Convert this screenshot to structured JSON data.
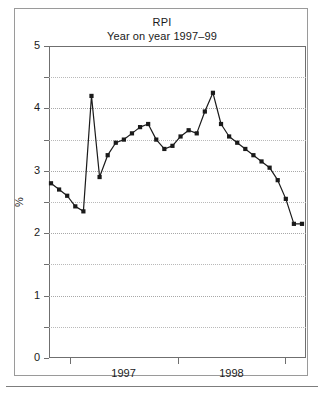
{
  "figure": {
    "title": "RPI",
    "subtitle": "Year on year 1997–99"
  },
  "chart_data": {
    "type": "line",
    "title": "RPI",
    "subtitle": "Year on year 1997–99",
    "xlabel": "",
    "ylabel": "%",
    "ylim": [
      0,
      5
    ],
    "ytick_labels": [
      "0",
      "1",
      "2",
      "3",
      "4",
      "5"
    ],
    "ytick_values": [
      0,
      1,
      2,
      3,
      4,
      5
    ],
    "yminor_step": 0.5,
    "grid": "horizontal-dotted",
    "legend": "none",
    "marker": "square",
    "line_color": "#1a1a1a",
    "xtick_positions": [
      0.08,
      0.5,
      0.92
    ],
    "xtick_labels": [
      "",
      "",
      ""
    ],
    "x_category_labels": [
      "1997",
      "1998"
    ],
    "x_category_centers": [
      0.29,
      0.71
    ],
    "series": [
      {
        "name": "RPI year on year",
        "values": [
          2.8,
          2.7,
          2.6,
          2.43,
          2.35,
          4.2,
          2.9,
          3.25,
          3.45,
          3.5,
          3.6,
          3.7,
          3.75,
          3.5,
          3.35,
          3.4,
          3.55,
          3.65,
          3.6,
          3.95,
          4.25,
          3.75,
          3.55,
          3.45,
          3.35,
          3.25,
          3.15,
          3.05,
          2.85,
          2.55,
          2.15,
          2.15
        ]
      }
    ]
  }
}
